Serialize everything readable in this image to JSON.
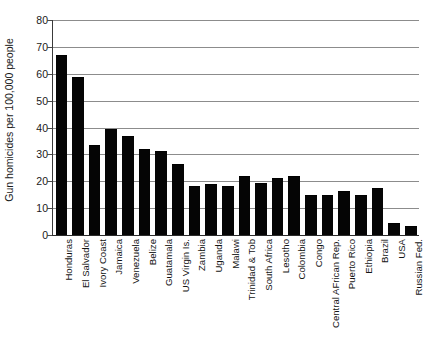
{
  "figure": {
    "clipped_top_title": "",
    "ylabel": "Gun homicides per 100,000 people"
  },
  "chart_data": {
    "type": "bar",
    "title": "",
    "xlabel": "",
    "ylabel": "Gun homicides per 100,000 people",
    "ylim": [
      0,
      80
    ],
    "yticks": [
      0,
      10,
      20,
      30,
      40,
      50,
      60,
      70,
      80
    ],
    "grid": true,
    "legend": null,
    "bar_color": "#050505",
    "categories": [
      "Honduras",
      "El Salvador",
      "Ivory Coast",
      "Jamaica",
      "Venezuela",
      "Belize",
      "Guatamala",
      "US Virgin Is.",
      "Zambia",
      "Uganda",
      "Malawi",
      "Trinidad & Tob",
      "South Africa",
      "Lesotho",
      "Colombia",
      "Congo",
      "Central AFrican Rep.",
      "Puerto Rico",
      "Ethiopia",
      "Brazil",
      "USA",
      "Russian Fed."
    ],
    "values": [
      66.5,
      58.5,
      33,
      39,
      36.5,
      31.5,
      31,
      26,
      18,
      18.5,
      18,
      21.5,
      19,
      21,
      21.5,
      14.5,
      14.5,
      16,
      14.5,
      17,
      4,
      3
    ]
  }
}
